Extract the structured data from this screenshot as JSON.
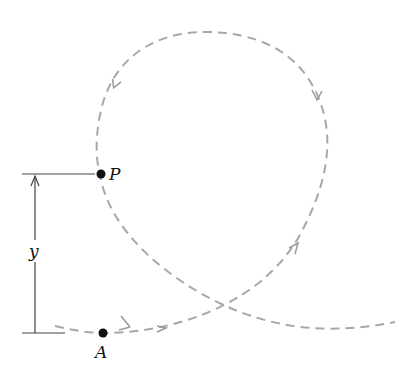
{
  "diagram": {
    "type": "loop-the-loop trajectory",
    "path_style": {
      "stroke": "#a8a8a8",
      "dash": "dashed"
    },
    "points": {
      "P": {
        "label": "P"
      },
      "A": {
        "label": "A"
      }
    },
    "dimension": {
      "label": "y",
      "from": "A",
      "to": "P"
    },
    "colors": {
      "line": "#a8a8a8",
      "ink": "#111111"
    }
  }
}
